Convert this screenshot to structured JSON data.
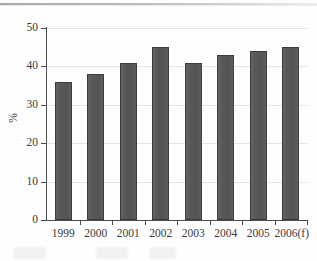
{
  "figure": {
    "background_color": "#fefefe",
    "bar_color": "#5a5a5a",
    "bar_border_color": "#3c3c3c",
    "axis_color": "#4c4c4c",
    "gridline_color": "#e4e4e4",
    "text_color": "#3b3b3b"
  },
  "chart_data": {
    "type": "bar",
    "title": "",
    "subtitle": "",
    "xlabel": "",
    "ylabel": "%",
    "categories": [
      "1999",
      "2000",
      "2001",
      "2002",
      "2003",
      "2004",
      "2005",
      "2006(f)"
    ],
    "values": [
      36,
      38,
      41,
      45,
      41,
      43,
      44,
      45
    ],
    "ylim": [
      0,
      50
    ],
    "yticks": [
      0,
      10,
      20,
      30,
      40,
      50
    ],
    "ytick_labels": [
      "0",
      "10",
      "20",
      "30",
      "40",
      "50"
    ],
    "grid": true,
    "grid_axis": "y",
    "legend": false,
    "legend_position": "none",
    "annotations": []
  }
}
